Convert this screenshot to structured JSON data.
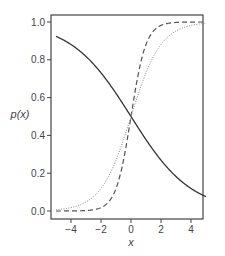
{
  "chart_data": {
    "type": "line",
    "title": "",
    "xlabel": "x",
    "ylabel": "p(x)",
    "xlim": [
      -5.3,
      5.3
    ],
    "ylim": [
      -0.04,
      1.04
    ],
    "x_ticks": [
      -4,
      -2,
      0,
      2,
      4
    ],
    "x_tick_labels": [
      "−4",
      "−2",
      "0",
      "2",
      "4"
    ],
    "y_ticks": [
      0.0,
      0.2,
      0.4,
      0.6,
      0.8,
      1.0
    ],
    "y_tick_labels": [
      "0.0",
      "0.2",
      "0.4",
      "0.6",
      "0.8",
      "1.0"
    ],
    "grid": false,
    "legend": null,
    "x": [
      -5,
      -4,
      -3,
      -2,
      -1,
      0,
      1,
      2,
      3,
      4,
      5
    ],
    "series": [
      {
        "name": "solid (decreasing logistic, slope -0.5)",
        "style": "solid",
        "color": "#333333",
        "values": [
          0.92,
          0.88,
          0.82,
          0.73,
          0.62,
          0.5,
          0.38,
          0.27,
          0.18,
          0.12,
          0.08
        ]
      },
      {
        "name": "dashed (steep logistic, slope 2)",
        "style": "dashed",
        "color": "#555555",
        "values": [
          0.0,
          0.0,
          0.0,
          0.02,
          0.12,
          0.5,
          0.88,
          0.98,
          1.0,
          1.0,
          1.0
        ]
      },
      {
        "name": "dotted (logistic, slope 1)",
        "style": "dotted",
        "color": "#888888",
        "values": [
          0.01,
          0.02,
          0.05,
          0.12,
          0.27,
          0.5,
          0.73,
          0.88,
          0.95,
          0.98,
          0.99
        ]
      }
    ]
  },
  "labels": {
    "xlabel": "x",
    "ylabel": "p(x)"
  }
}
